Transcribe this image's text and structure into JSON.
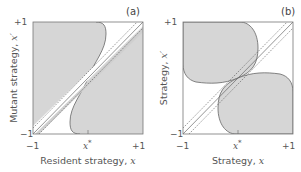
{
  "figure": {
    "panels": [
      {
        "id": "a",
        "label": "(a)",
        "xlabel_text": "Resident strategy, ",
        "xlabel_var": "x",
        "ylabel_text": "Mutant strategy, ",
        "ylabel_var": "x′",
        "x_ticks": [
          "−1",
          "+1"
        ],
        "y_ticks": [
          "−1",
          "+1"
        ],
        "x_star_label": "x",
        "x_star_sup": "*",
        "description": "Pairwise invasibility plot: shaded regions where mutant can invade; branching-type singular point at x*"
      },
      {
        "id": "b",
        "label": "(b)",
        "xlabel_text": "Strategy, ",
        "xlabel_var": "x",
        "ylabel_text": "Strategy, ",
        "ylabel_var": "x′",
        "x_ticks": [
          "−1",
          "+1"
        ],
        "y_ticks": [
          "−1",
          "+1"
        ],
        "x_star_label": "x",
        "x_star_sup": "*",
        "description": "Mutual invasibility plot: shaded regions of protected coexistence, two lobes meeting at x*"
      }
    ],
    "colors": {
      "shade": "#d6d6d6",
      "frame": "#777777",
      "curve": "#666666",
      "dashed": "#555555"
    },
    "axis_range": [
      -1,
      1
    ],
    "x_star": 0
  }
}
